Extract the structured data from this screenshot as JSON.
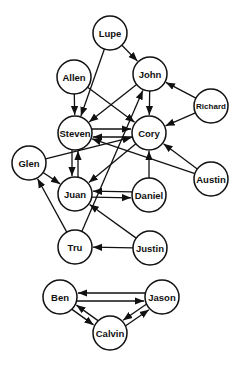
{
  "diagram": {
    "type": "directed-graph",
    "node_radius": 17,
    "colors": {
      "stroke": "#111111",
      "fill": "#ffffff",
      "background": "#ffffff"
    },
    "nodes": [
      {
        "id": "Lupe",
        "label": "Lupe",
        "x": 110,
        "y": 33
      },
      {
        "id": "Allen",
        "label": "Allen",
        "x": 74,
        "y": 77
      },
      {
        "id": "John",
        "label": "John",
        "x": 150,
        "y": 74
      },
      {
        "id": "Richard",
        "label": "Richard",
        "x": 211,
        "y": 106
      },
      {
        "id": "Steven",
        "label": "Steven",
        "x": 75,
        "y": 133
      },
      {
        "id": "Cory",
        "label": "Cory",
        "x": 149,
        "y": 133
      },
      {
        "id": "Glen",
        "label": "Glen",
        "x": 29,
        "y": 163
      },
      {
        "id": "Austin",
        "label": "Austin",
        "x": 211,
        "y": 179
      },
      {
        "id": "Juan",
        "label": "Juan",
        "x": 75,
        "y": 194
      },
      {
        "id": "Daniel",
        "label": "Daniel",
        "x": 149,
        "y": 195
      },
      {
        "id": "Tru",
        "label": "Tru",
        "x": 75,
        "y": 247
      },
      {
        "id": "Justin",
        "label": "Justin",
        "x": 150,
        "y": 248
      },
      {
        "id": "Ben",
        "label": "Ben",
        "x": 60,
        "y": 297
      },
      {
        "id": "Jason",
        "label": "Jason",
        "x": 162,
        "y": 297
      },
      {
        "id": "Calvin",
        "label": "Calvin",
        "x": 110,
        "y": 333
      }
    ],
    "edges": [
      {
        "from": "Lupe",
        "to": "John"
      },
      {
        "from": "Lupe",
        "to": "Steven"
      },
      {
        "from": "Allen",
        "to": "Steven"
      },
      {
        "from": "Allen",
        "to": "Cory"
      },
      {
        "from": "John",
        "to": "Steven"
      },
      {
        "from": "John",
        "to": "Cory"
      },
      {
        "from": "Richard",
        "to": "John"
      },
      {
        "from": "Richard",
        "to": "Cory"
      },
      {
        "from": "Steven",
        "to": "Cory",
        "offset": -4
      },
      {
        "from": "Cory",
        "to": "Steven",
        "offset": -4
      },
      {
        "from": "Steven",
        "to": "Juan",
        "offset": 3
      },
      {
        "from": "Juan",
        "to": "Steven",
        "offset": 3
      },
      {
        "from": "Glen",
        "to": "Cory"
      },
      {
        "from": "Glen",
        "to": "Juan"
      },
      {
        "from": "Cory",
        "to": "Juan"
      },
      {
        "from": "Austin",
        "to": "Cory"
      },
      {
        "from": "Austin",
        "to": "Steven"
      },
      {
        "from": "Daniel",
        "to": "Cory"
      },
      {
        "from": "Daniel",
        "to": "Juan",
        "offset": 3
      },
      {
        "from": "Juan",
        "to": "Daniel",
        "offset": 3
      },
      {
        "from": "Tru",
        "to": "Glen"
      },
      {
        "from": "Tru",
        "to": "John"
      },
      {
        "from": "Justin",
        "to": "Tru"
      },
      {
        "from": "Justin",
        "to": "Juan"
      },
      {
        "from": "Jason",
        "to": "Ben",
        "offset": 4
      },
      {
        "from": "Ben",
        "to": "Jason",
        "offset": 4
      },
      {
        "from": "Ben",
        "to": "Calvin",
        "offset": 3
      },
      {
        "from": "Calvin",
        "to": "Ben",
        "offset": 3
      },
      {
        "from": "Calvin",
        "to": "Jason",
        "offset": 3
      },
      {
        "from": "Jason",
        "to": "Calvin",
        "offset": 3
      }
    ]
  }
}
